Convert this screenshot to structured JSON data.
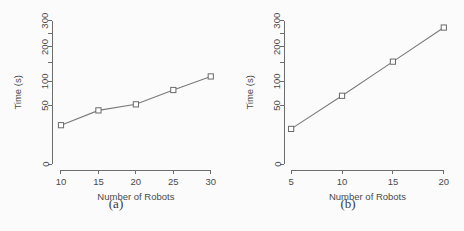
{
  "figure": {
    "panels": [
      {
        "caption": "(a)",
        "chart_data": {
          "type": "line",
          "title": "",
          "xlabel": "Number of Robots",
          "ylabel": "Time (s)",
          "x": [
            10,
            15,
            20,
            25,
            30
          ],
          "values": [
            22,
            42,
            52,
            80,
            112
          ],
          "xticks": [
            10,
            15,
            20,
            25,
            30
          ],
          "xtick_labels": [
            "10",
            "15",
            "20",
            "25",
            "30"
          ],
          "yticks": [
            0,
            50,
            100,
            200,
            300
          ],
          "ytick_labels": [
            "0",
            "50",
            "100",
            "200",
            "300"
          ],
          "xlim": [
            8.8,
            31.5
          ],
          "ylim": [
            0,
            320
          ],
          "yscale": "sqrt",
          "grid": false,
          "legend": "none",
          "marker": "open-square",
          "line_color": "#7a7a7a",
          "marker_color": "#6a6a6a"
        }
      },
      {
        "caption": "(b)",
        "chart_data": {
          "type": "line",
          "title": "",
          "xlabel": "Number of Robots",
          "ylabel": "Time (s)",
          "x": [
            5,
            10,
            15,
            20
          ],
          "values": [
            18,
            68,
            153,
            272
          ],
          "xticks": [
            5,
            10,
            15,
            20
          ],
          "xtick_labels": [
            "5",
            "10",
            "15",
            "20"
          ],
          "yticks": [
            0,
            50,
            100,
            200,
            300
          ],
          "ytick_labels": [
            "0",
            "50",
            "100",
            "200",
            "300"
          ],
          "xlim": [
            4.3,
            21.0
          ],
          "ylim": [
            0,
            320
          ],
          "yscale": "sqrt",
          "grid": false,
          "legend": "none",
          "marker": "open-square",
          "line_color": "#7a7a7a",
          "marker_color": "#6a6a6a"
        }
      }
    ]
  }
}
